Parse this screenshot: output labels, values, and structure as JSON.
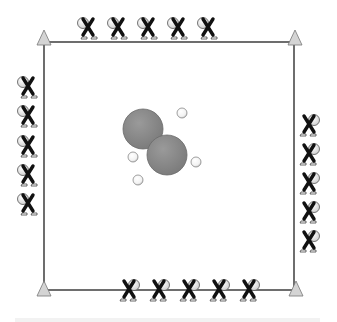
{
  "diagram": {
    "type": "sports-drill",
    "field": {
      "left": 44,
      "top": 42,
      "right": 294,
      "bottom": 290,
      "line_color": "#4a4a4a"
    },
    "cones": [
      {
        "id": "cone-top-left",
        "x": 44,
        "y": 38
      },
      {
        "id": "cone-top-right",
        "x": 295,
        "y": 38
      },
      {
        "id": "cone-bottom-left",
        "x": 44,
        "y": 289
      },
      {
        "id": "cone-bottom-right",
        "x": 296,
        "y": 289
      }
    ],
    "cone_color": "#d4d4d4",
    "players": {
      "top": [
        {
          "x": 88,
          "y": 28
        },
        {
          "x": 118,
          "y": 28
        },
        {
          "x": 148,
          "y": 28
        },
        {
          "x": 178,
          "y": 28
        },
        {
          "x": 208,
          "y": 28
        }
      ],
      "left": [
        {
          "x": 27,
          "y": 86
        },
        {
          "x": 27,
          "y": 115
        },
        {
          "x": 27,
          "y": 145
        },
        {
          "x": 27,
          "y": 174
        },
        {
          "x": 27,
          "y": 203
        }
      ],
      "right": [
        {
          "x": 310,
          "y": 124
        },
        {
          "x": 310,
          "y": 153
        },
        {
          "x": 310,
          "y": 182
        },
        {
          "x": 310,
          "y": 211
        },
        {
          "x": 310,
          "y": 240
        }
      ],
      "bottom": [
        {
          "x": 129,
          "y": 290
        },
        {
          "x": 159,
          "y": 290
        },
        {
          "x": 189,
          "y": 290
        },
        {
          "x": 219,
          "y": 290
        },
        {
          "x": 249,
          "y": 290
        }
      ]
    },
    "player_marker": "X",
    "big_circles": [
      {
        "x": 143,
        "y": 129,
        "r": 20
      },
      {
        "x": 167,
        "y": 155,
        "r": 20
      }
    ],
    "big_circle_color": "#8a8a8a",
    "balls": [
      {
        "x": 182,
        "y": 113,
        "r": 5
      },
      {
        "x": 133,
        "y": 157,
        "r": 5
      },
      {
        "x": 196,
        "y": 162,
        "r": 5
      },
      {
        "x": 138,
        "y": 180,
        "r": 5
      }
    ]
  }
}
